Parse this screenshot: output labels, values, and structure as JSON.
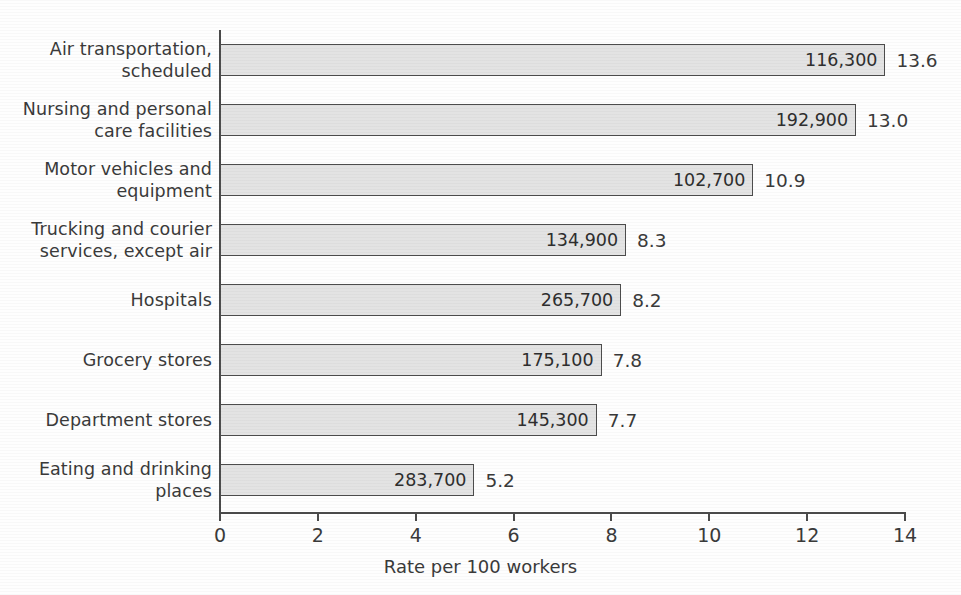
{
  "chart_data": {
    "type": "bar",
    "orientation": "horizontal",
    "title": "",
    "xlabel": "Rate per 100 workers",
    "ylabel": "",
    "xlim": [
      0,
      14
    ],
    "xticks": [
      "0",
      "2",
      "4",
      "6",
      "8",
      "10",
      "12",
      "14"
    ],
    "grid": false,
    "legend": null,
    "categories": [
      "Air transportation,\nscheduled",
      "Nursing and personal\ncare facilities",
      "Motor vehicles and\nequipment",
      "Trucking and courier\nservices, except air",
      "Hospitals",
      "Grocery stores",
      "Department stores",
      "Eating and drinking\nplaces"
    ],
    "values": [
      13.6,
      13.0,
      10.9,
      8.3,
      8.2,
      7.8,
      7.7,
      5.2
    ],
    "value_labels": [
      "13.6",
      "13.0",
      "10.9",
      "8.3",
      "8.2",
      "7.8",
      "7.7",
      "5.2"
    ],
    "counts": [
      "116,300",
      "192,900",
      "102,700",
      "134,900",
      "265,700",
      "175,100",
      "145,300",
      "283,700"
    ],
    "bar_fill_color": "#e3e3e3",
    "bar_border_color": "#4d4d4d",
    "axis_color": "#4a4a4a"
  }
}
